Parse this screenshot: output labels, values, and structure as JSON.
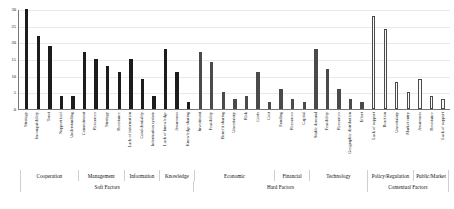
{
  "chart_data": {
    "type": "bar",
    "title": "",
    "xlabel": "",
    "ylabel": "",
    "ylim": [
      0,
      30
    ],
    "yticks": [
      0,
      5,
      10,
      15,
      20,
      25,
      30
    ],
    "grid": true,
    "legend": "none",
    "categories": [
      "Strategy",
      "Incompatibility",
      "Trust",
      "Support tool",
      "Understanding",
      "Commitment",
      "Resources",
      "Strategy",
      "Resistance",
      "Lack of information",
      "Confidentiality",
      "Information system",
      "Lack of knowledge",
      "Awareness",
      "Knowledge sharing",
      "Investment",
      "Feasibility",
      "Benefit sharing",
      "Uncertainty",
      "Risk",
      "Costs",
      "Cost",
      "Funding",
      "Resources",
      "Capital",
      "Stable demand",
      "Feasibility",
      "Resources",
      "Geographic distribution",
      "Effort",
      "Lack of support",
      "Reaction",
      "Uncertainty",
      "Market entry",
      "Awareness",
      "Resistance",
      "Lack of support"
    ],
    "values": [
      30,
      22,
      19,
      4,
      4,
      17,
      15,
      13,
      11,
      15,
      9,
      4,
      18,
      11,
      2,
      17,
      14,
      5,
      3,
      4,
      11,
      2,
      6,
      3,
      2,
      18,
      12,
      6,
      3,
      2,
      28,
      24,
      8,
      5,
      9,
      4,
      3
    ],
    "bar_styles": [
      "soft",
      "soft",
      "soft",
      "soft",
      "soft",
      "soft",
      "soft",
      "soft",
      "soft",
      "soft",
      "soft",
      "soft",
      "soft",
      "soft",
      "soft",
      "hard",
      "hard",
      "hard",
      "hard",
      "hard",
      "hard",
      "hard",
      "hard",
      "hard",
      "hard",
      "hard",
      "hard",
      "hard",
      "hard",
      "hard",
      "ctx",
      "ctx",
      "ctx",
      "ctx",
      "ctx",
      "ctx",
      "ctx"
    ],
    "groups": [
      {
        "label": "Cooperation",
        "span": 5
      },
      {
        "label": "Management",
        "span": 4
      },
      {
        "label": "Information",
        "span": 3
      },
      {
        "label": "Knowledge",
        "span": 3
      },
      {
        "label": "Economic",
        "span": 7
      },
      {
        "label": "Financial",
        "span": 3
      },
      {
        "label": "Technology",
        "span": 5
      },
      {
        "label": "Policy/Regulation",
        "span": 4
      },
      {
        "label": "Public/Market",
        "span": 3
      }
    ],
    "supergroups": [
      {
        "label": "Soft Factors",
        "span": 15
      },
      {
        "label": "Hard Factors",
        "span": 15
      },
      {
        "label": "Contextual Factors",
        "span": 7
      }
    ],
    "colors": {
      "soft_bar": "#1c1c1c",
      "hard_bar": "#4a4a4a",
      "contextual_bar": "#fbfbfb",
      "contextual_bar_edge": "#4a4a4a",
      "axis": "#777777",
      "grid": "#e9e9e9",
      "text": "#1a1a1a",
      "background": "#ffffff"
    }
  }
}
